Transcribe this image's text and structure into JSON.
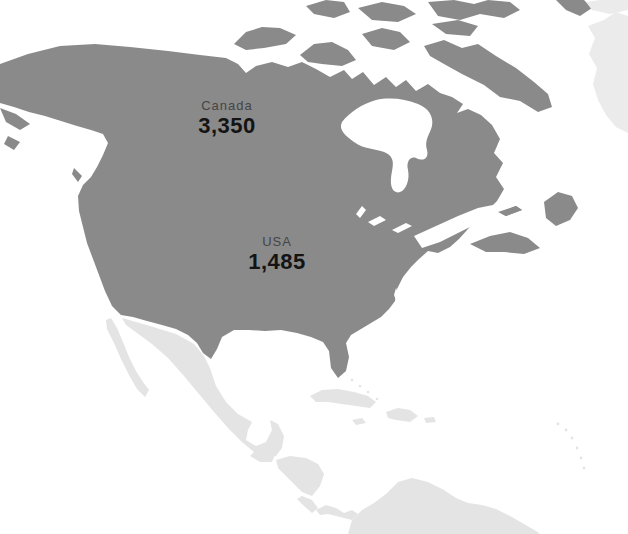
{
  "map": {
    "regions": {
      "canada": {
        "name": "Canada",
        "value": "3,350"
      },
      "usa": {
        "name": "USA",
        "value": "1,485"
      }
    },
    "colors": {
      "highlight": "#8a8a8a",
      "muted": "#e4e4e4",
      "greenland": "#ebebeb",
      "ocean": "#ffffff",
      "label_name": "#454545",
      "label_value": "#141414"
    }
  }
}
